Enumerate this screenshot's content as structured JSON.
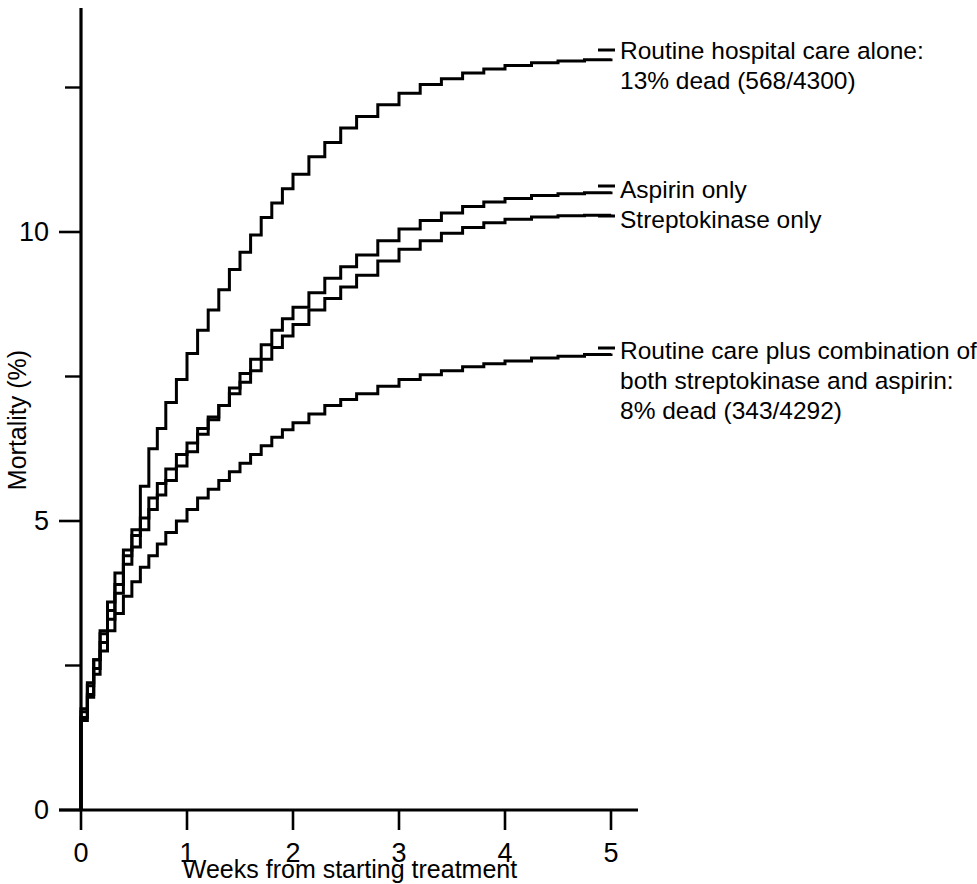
{
  "chart_data": {
    "type": "line",
    "title": "",
    "subtitle": "",
    "xlabel": "Weeks from starting treatment",
    "ylabel": "Mortality (%)",
    "xlim": [
      0,
      5.2
    ],
    "ylim": [
      0,
      13.9
    ],
    "xticks": [
      0,
      1,
      2,
      3,
      4,
      5
    ],
    "xtick_labels": [
      "0",
      "1",
      "2",
      "3",
      "4",
      "5"
    ],
    "yticks": [
      0,
      5,
      10
    ],
    "ytick_labels": [
      "0",
      "5",
      "10"
    ],
    "yticks_minor": [
      2.5,
      7.5,
      12.5
    ],
    "grid": false,
    "legend_position": "right-inline-annotations",
    "step_type": "post",
    "series": [
      {
        "name": "Routine hospital care alone",
        "label_lines": [
          "Routine hospital care alone:",
          "13% dead (568/4300)"
        ],
        "final_value": 13.0,
        "x": [
          0,
          0.06,
          0.12,
          0.18,
          0.25,
          0.32,
          0.4,
          0.48,
          0.56,
          0.64,
          0.72,
          0.8,
          0.9,
          1.0,
          1.1,
          1.2,
          1.3,
          1.4,
          1.5,
          1.6,
          1.7,
          1.8,
          1.9,
          2.0,
          2.15,
          2.3,
          2.45,
          2.6,
          2.8,
          3.0,
          3.2,
          3.4,
          3.6,
          3.8,
          4.0,
          4.25,
          4.5,
          4.75,
          5.0
        ],
        "y": [
          1.75,
          2.2,
          2.6,
          3.1,
          3.6,
          4.1,
          4.5,
          4.85,
          5.6,
          6.25,
          6.6,
          7.05,
          7.45,
          7.9,
          8.3,
          8.65,
          9.0,
          9.35,
          9.65,
          9.95,
          10.25,
          10.5,
          10.75,
          11.0,
          11.3,
          11.55,
          11.8,
          12.0,
          12.2,
          12.4,
          12.55,
          12.65,
          12.75,
          12.82,
          12.88,
          12.93,
          12.96,
          12.98,
          13.0
        ]
      },
      {
        "name": "Aspirin only",
        "label_lines": [
          "Aspirin only"
        ],
        "final_value": 10.7,
        "x": [
          0,
          0.06,
          0.12,
          0.18,
          0.25,
          0.32,
          0.4,
          0.48,
          0.56,
          0.64,
          0.72,
          0.8,
          0.9,
          1.0,
          1.1,
          1.2,
          1.3,
          1.4,
          1.5,
          1.6,
          1.7,
          1.8,
          1.9,
          2.0,
          2.15,
          2.3,
          2.45,
          2.6,
          2.8,
          3.0,
          3.2,
          3.4,
          3.6,
          3.8,
          4.0,
          4.25,
          4.5,
          4.75,
          5.0
        ],
        "y": [
          1.6,
          2.0,
          2.45,
          2.9,
          3.3,
          3.75,
          4.25,
          4.55,
          4.85,
          5.2,
          5.45,
          5.7,
          5.95,
          6.2,
          6.5,
          6.75,
          7.0,
          7.3,
          7.55,
          7.8,
          8.05,
          8.3,
          8.5,
          8.7,
          8.95,
          9.2,
          9.4,
          9.6,
          9.85,
          10.05,
          10.2,
          10.33,
          10.44,
          10.52,
          10.58,
          10.63,
          10.66,
          10.68,
          10.7
        ]
      },
      {
        "name": "Streptokinase only",
        "label_lines": [
          "Streptokinase only"
        ],
        "final_value": 10.3,
        "x": [
          0,
          0.06,
          0.12,
          0.18,
          0.25,
          0.32,
          0.4,
          0.48,
          0.56,
          0.64,
          0.72,
          0.8,
          0.9,
          1.0,
          1.1,
          1.2,
          1.3,
          1.4,
          1.5,
          1.6,
          1.7,
          1.8,
          1.9,
          2.0,
          2.15,
          2.3,
          2.45,
          2.6,
          2.8,
          3.0,
          3.2,
          3.4,
          3.6,
          3.8,
          4.0,
          4.25,
          4.5,
          4.75,
          5.0
        ],
        "y": [
          1.7,
          2.15,
          2.6,
          3.05,
          3.45,
          3.9,
          4.4,
          4.75,
          5.05,
          5.4,
          5.65,
          5.9,
          6.15,
          6.35,
          6.6,
          6.8,
          7.0,
          7.2,
          7.4,
          7.6,
          7.8,
          8.0,
          8.2,
          8.4,
          8.65,
          8.85,
          9.05,
          9.25,
          9.5,
          9.7,
          9.85,
          9.98,
          10.08,
          10.16,
          10.22,
          10.26,
          10.28,
          10.29,
          10.3
        ]
      },
      {
        "name": "Routine care plus combination of both streptokinase and aspirin",
        "label_lines": [
          "Routine care plus combination of",
          "both streptokinase and aspirin:",
          "8% dead (343/4292)"
        ],
        "final_value": 7.9,
        "x": [
          0,
          0.06,
          0.12,
          0.18,
          0.25,
          0.32,
          0.4,
          0.48,
          0.56,
          0.64,
          0.72,
          0.8,
          0.9,
          1.0,
          1.1,
          1.2,
          1.3,
          1.4,
          1.5,
          1.6,
          1.7,
          1.8,
          1.9,
          2.0,
          2.15,
          2.3,
          2.45,
          2.6,
          2.8,
          3.0,
          3.2,
          3.4,
          3.6,
          3.8,
          4.0,
          4.25,
          4.5,
          4.75,
          5.0
        ],
        "y": [
          1.55,
          1.95,
          2.35,
          2.75,
          3.1,
          3.4,
          3.7,
          3.95,
          4.2,
          4.4,
          4.6,
          4.8,
          5.0,
          5.2,
          5.4,
          5.55,
          5.7,
          5.85,
          6.0,
          6.15,
          6.3,
          6.45,
          6.58,
          6.7,
          6.85,
          7.0,
          7.1,
          7.2,
          7.33,
          7.45,
          7.53,
          7.6,
          7.67,
          7.72,
          7.77,
          7.82,
          7.85,
          7.88,
          7.9
        ]
      }
    ]
  },
  "annotations": {
    "routine_alone_line1": "Routine hospital care alone:",
    "routine_alone_line2": "13% dead (568/4300)",
    "aspirin_only": "Aspirin only",
    "streptokinase_only": "Streptokinase only",
    "combination_line1": "Routine care plus combination of",
    "combination_line2": "both streptokinase and aspirin:",
    "combination_line3": "8% dead (343/4292)"
  },
  "colors": {
    "curve": "#000000",
    "axis": "#000000",
    "background": "#ffffff"
  }
}
